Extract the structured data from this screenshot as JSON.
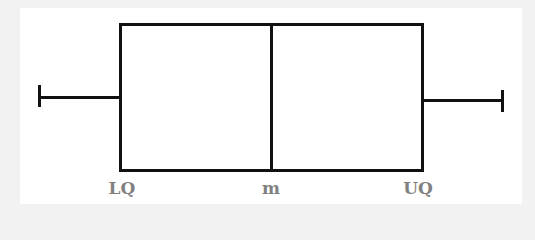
{
  "diagram": {
    "type": "box-and-whisker plot",
    "labels": {
      "lower_quartile": "LQ",
      "median": "m",
      "upper_quartile": "UQ"
    },
    "colors": {
      "background": "#f2f2f2",
      "panel": "#ffffff",
      "stroke": "#111111",
      "label": "#808080"
    }
  }
}
